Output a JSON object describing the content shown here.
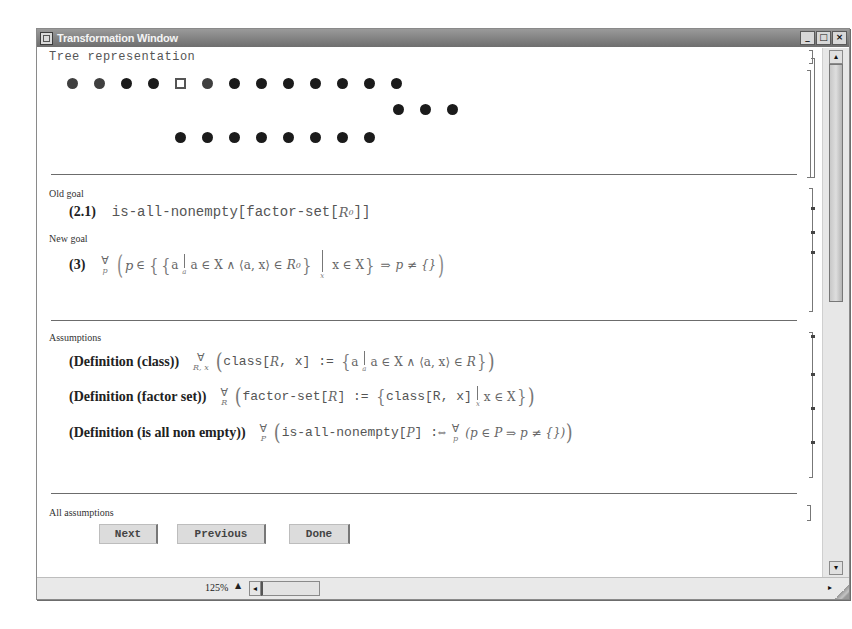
{
  "window": {
    "title": "Transformation Window",
    "controls": {
      "minimize": "_",
      "maximize": "□",
      "close": "×"
    }
  },
  "tree": {
    "title": "Tree representation",
    "rows": [
      {
        "nodes": [
          "gray",
          "gray",
          "filled",
          "filled",
          "selected",
          "gray",
          "filled",
          "filled",
          "filled",
          "filled",
          "filled",
          "filled",
          "filled"
        ]
      },
      {
        "nodes": [
          "filled",
          "filled",
          "filled"
        ]
      },
      {
        "nodes": [
          "filled",
          "filled",
          "filled",
          "filled",
          "filled",
          "filled",
          "filled",
          "filled"
        ]
      }
    ]
  },
  "goals": {
    "old_label": "Old goal",
    "old": {
      "number": "(2.1)",
      "text_a": "is-all-nonempty[factor-set[",
      "var": "R",
      "var_sub": "0",
      "text_b": "]]"
    },
    "new_label": "New goal",
    "new": {
      "number": "(3)",
      "quant": "∀",
      "quant_sub": "p",
      "p": "p",
      "in": "∈",
      "open_outer": "{",
      "open_inner": "{",
      "a": "a",
      "bar_sub_a": "a",
      "cond": "a ∈ X ∧ ⟨a, x⟩ ∈",
      "R": "R",
      "R_sub": "0",
      "close_inner": "}",
      "bar_sub_x": "x",
      "xcond": "x ∈ X",
      "close_outer": "}",
      "implies": "⇒",
      "tail": "p ≠ {}"
    }
  },
  "assumptions": {
    "label": "Assumptions",
    "items": [
      {
        "name": "(Definition (class))",
        "quant": "∀",
        "quant_sub": "R, x",
        "lhs": "class[",
        "lhs_R": "R",
        "lhs_rest": ", x] :=",
        "set_head": "a",
        "bar_sub": "a",
        "set_body": "a ∈ X ∧ ⟨a, x⟩ ∈",
        "set_R": "R"
      },
      {
        "name": "(Definition (factor set))",
        "quant": "∀",
        "quant_sub": "R",
        "lhs": "factor-set[",
        "lhs_R": "R",
        "lhs_rest": "] :=",
        "set_head": "class[R, x]",
        "bar_sub": "x",
        "set_body": "x ∈ X"
      },
      {
        "name": "(Definition (is all non empty))",
        "quant": "∀",
        "quant_sub": "P",
        "lhs": "is-all-nonempty[",
        "lhs_R": "P",
        "lhs_rest": "] :⇔",
        "inner_quant": "∀",
        "inner_quant_sub": "p",
        "body": "(p ∈ P ⇒ p ≠ {})"
      }
    ]
  },
  "footer": {
    "label": "All assumptions",
    "buttons": {
      "next": "Next",
      "previous": "Previous",
      "done": "Done"
    }
  },
  "statusbar": {
    "zoom": "125%",
    "zoom_arrow": "▲",
    "scroll_left": "◂",
    "scroll_right": "▸",
    "scroll_up": "▴",
    "scroll_down": "▾"
  }
}
